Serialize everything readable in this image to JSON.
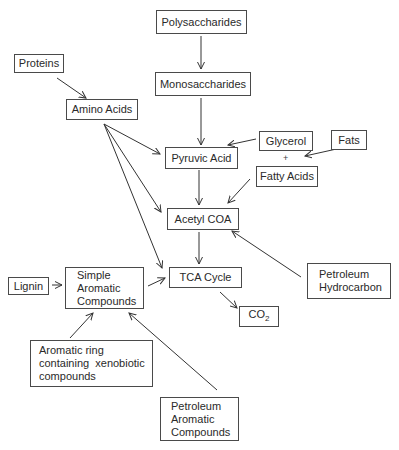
{
  "diagram": {
    "nodes": {
      "polysaccharides": "Polysaccharides",
      "monosaccharides": "Monosaccharides",
      "proteins": "Proteins",
      "amino_acids": "Amino Acids",
      "pyruvic_acid": "Pyruvic Acid",
      "glycerol": "Glycerol",
      "plus": "+",
      "fats": "Fats",
      "fatty_acids": "Fatty Acids",
      "acetyl_coa": "Acetyl COA",
      "tca_cycle": "TCA Cycle",
      "lignin": "Lignin",
      "simple_aromatic": [
        "Simple",
        "Aromatic",
        "Compounds"
      ],
      "petroleum_hydrocarbon": [
        "Petroleum",
        "Hydrocarbon"
      ],
      "co2_main": "CO",
      "co2_sub": "2",
      "aromatic_ring": [
        "Aromatic ring",
        "containing  xenobiotic",
        "compounds"
      ],
      "petroleum_aromatic": [
        "Petroleum",
        "Aromatic",
        "Compounds"
      ]
    },
    "edges": [
      {
        "from": "Polysaccharides",
        "to": "Monosaccharides"
      },
      {
        "from": "Monosaccharides",
        "to": "Pyruvic Acid"
      },
      {
        "from": "Proteins",
        "to": "Amino Acids"
      },
      {
        "from": "Amino Acids",
        "to": "Pyruvic Acid"
      },
      {
        "from": "Amino Acids",
        "to": "Acetyl COA"
      },
      {
        "from": "Amino Acids",
        "to": "TCA Cycle"
      },
      {
        "from": "Glycerol",
        "to": "Pyruvic Acid"
      },
      {
        "from": "Fats",
        "to": "Glycerol + Fatty Acids"
      },
      {
        "from": "Fatty Acids",
        "to": "Acetyl COA"
      },
      {
        "from": "Pyruvic Acid",
        "to": "Acetyl COA"
      },
      {
        "from": "Acetyl COA",
        "to": "TCA Cycle"
      },
      {
        "from": "Petroleum Hydrocarbon",
        "to": "Acetyl COA"
      },
      {
        "from": "TCA Cycle",
        "to": "CO2"
      },
      {
        "from": "Lignin",
        "to": "Simple Aromatic Compounds"
      },
      {
        "from": "Simple Aromatic Compounds",
        "to": "TCA Cycle"
      },
      {
        "from": "Aromatic ring containing xenobiotic compounds",
        "to": "Simple Aromatic Compounds"
      },
      {
        "from": "Petroleum Aromatic Compounds",
        "to": "Simple Aromatic Compounds"
      }
    ]
  }
}
